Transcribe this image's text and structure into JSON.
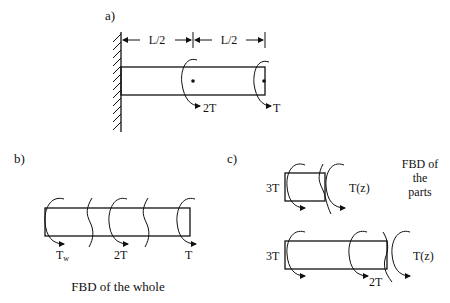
{
  "panels": {
    "a": {
      "label": "a)",
      "dimensions": [
        "L/2",
        "L/2"
      ],
      "torques": [
        "2T",
        "T"
      ]
    },
    "b": {
      "label": "b)",
      "torques": [
        "Tw",
        "2T",
        "T"
      ],
      "torque_wall_main": "T",
      "torque_wall_sub": "w",
      "caption": "FBD of the whole"
    },
    "c": {
      "label": "c)",
      "upper": {
        "left": "3T",
        "right": "T(z)"
      },
      "lower": {
        "left": "3T",
        "mid": "2T",
        "right": "T(z)"
      },
      "caption_lines": [
        "FBD of",
        "the",
        "parts"
      ]
    }
  }
}
